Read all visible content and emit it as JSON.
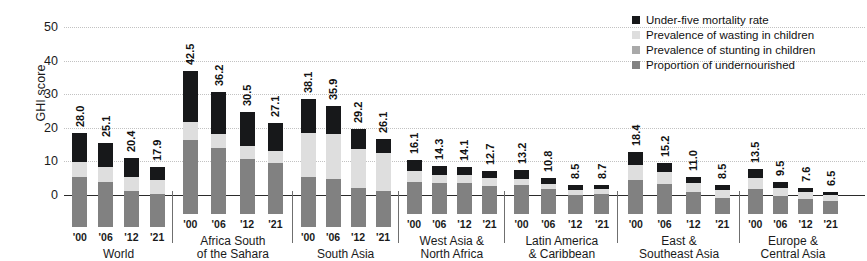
{
  "chart_data": {
    "type": "bar",
    "subtype": "stacked-grouped-bar",
    "title": "",
    "xlabel": "",
    "ylabel": "GHI score",
    "ylim": [
      0,
      50
    ],
    "yticks": [
      0,
      10,
      20,
      30,
      40,
      50
    ],
    "grid": true,
    "legend_position": "top-right",
    "categories": [
      "'00",
      "'06",
      "'12",
      "'21"
    ],
    "groups": [
      {
        "name": "World",
        "name_lines": [
          "World"
        ],
        "bars": [
          {
            "year": "'00",
            "total": "28.0",
            "segments": {
              "undernourished": 14.8,
              "stunting": 0.0,
              "wasting": 4.6,
              "mortality": 8.6
            }
          },
          {
            "year": "'06",
            "total": "25.1",
            "segments": {
              "undernourished": 13.3,
              "stunting": 0.0,
              "wasting": 4.5,
              "mortality": 7.3
            }
          },
          {
            "year": "'12",
            "total": "20.4",
            "segments": {
              "undernourished": 10.6,
              "stunting": 0.0,
              "wasting": 4.4,
              "mortality": 5.4
            }
          },
          {
            "year": "'21",
            "total": "17.9",
            "segments": {
              "undernourished": 9.8,
              "stunting": 0.0,
              "wasting": 4.3,
              "mortality": 3.8
            }
          }
        ]
      },
      {
        "name": "Africa South of the Sahara",
        "name_lines": [
          "Africa South",
          "of the Sahara"
        ],
        "bars": [
          {
            "year": "'00",
            "total": "42.5",
            "segments": {
              "undernourished": 21.9,
              "stunting": 0.0,
              "wasting": 5.4,
              "mortality": 15.2
            }
          },
          {
            "year": "'06",
            "total": "36.2",
            "segments": {
              "undernourished": 19.6,
              "stunting": 0.0,
              "wasting": 4.2,
              "mortality": 12.4
            }
          },
          {
            "year": "'12",
            "total": "30.5",
            "segments": {
              "undernourished": 16.3,
              "stunting": 0.0,
              "wasting": 3.9,
              "mortality": 10.3
            }
          },
          {
            "year": "'21",
            "total": "27.1",
            "segments": {
              "undernourished": 15.1,
              "stunting": 0.0,
              "wasting": 3.6,
              "mortality": 8.4
            }
          }
        ]
      },
      {
        "name": "South Asia",
        "name_lines": [
          "South Asia"
        ],
        "bars": [
          {
            "year": "'00",
            "total": "38.1",
            "segments": {
              "undernourished": 15.0,
              "stunting": 0.0,
              "wasting": 13.0,
              "mortality": 10.1
            }
          },
          {
            "year": "'06",
            "total": "35.9",
            "segments": {
              "undernourished": 14.2,
              "stunting": 0.0,
              "wasting": 13.4,
              "mortality": 8.3
            }
          },
          {
            "year": "'12",
            "total": "29.2",
            "segments": {
              "undernourished": 11.6,
              "stunting": 0.0,
              "wasting": 11.6,
              "mortality": 6.0
            }
          },
          {
            "year": "'21",
            "total": "26.1",
            "segments": {
              "undernourished": 10.8,
              "stunting": 0.0,
              "wasting": 11.3,
              "mortality": 4.0
            }
          }
        ]
      },
      {
        "name": "West Asia & North Africa",
        "name_lines": [
          "West Asia &",
          "North Africa"
        ],
        "bars": [
          {
            "year": "'00",
            "total": "16.1",
            "segments": {
              "undernourished": 9.6,
              "stunting": 0.0,
              "wasting": 3.2,
              "mortality": 3.3
            }
          },
          {
            "year": "'06",
            "total": "14.3",
            "segments": {
              "undernourished": 9.1,
              "stunting": 0.0,
              "wasting": 2.6,
              "mortality": 2.6
            }
          },
          {
            "year": "'12",
            "total": "14.1",
            "segments": {
              "undernourished": 9.2,
              "stunting": 0.0,
              "wasting": 2.5,
              "mortality": 2.4
            }
          },
          {
            "year": "'21",
            "total": "12.7",
            "segments": {
              "undernourished": 8.4,
              "stunting": 0.0,
              "wasting": 2.3,
              "mortality": 2.0
            }
          }
        ]
      },
      {
        "name": "Latin America & Caribbean",
        "name_lines": [
          "Latin America",
          "& Caribbean"
        ],
        "bars": [
          {
            "year": "'00",
            "total": "13.2",
            "segments": {
              "undernourished": 8.6,
              "stunting": 0.0,
              "wasting": 1.8,
              "mortality": 2.8
            }
          },
          {
            "year": "'06",
            "total": "10.8",
            "segments": {
              "undernourished": 7.5,
              "stunting": 0.0,
              "wasting": 1.5,
              "mortality": 1.8
            }
          },
          {
            "year": "'12",
            "total": "8.5",
            "segments": {
              "undernourished": 5.8,
              "stunting": 0.0,
              "wasting": 1.4,
              "mortality": 1.3
            }
          },
          {
            "year": "'21",
            "total": "8.7",
            "segments": {
              "undernourished": 6.0,
              "stunting": 0.0,
              "wasting": 1.5,
              "mortality": 1.2
            }
          }
        ]
      },
      {
        "name": "East & Southeast Asia",
        "name_lines": [
          "East &",
          "Southeast Asia"
        ],
        "bars": [
          {
            "year": "'00",
            "total": "18.4",
            "segments": {
              "undernourished": 10.2,
              "stunting": 0.0,
              "wasting": 4.5,
              "mortality": 3.7
            }
          },
          {
            "year": "'06",
            "total": "15.2",
            "segments": {
              "undernourished": 9.0,
              "stunting": 0.0,
              "wasting": 3.6,
              "mortality": 2.6
            }
          },
          {
            "year": "'12",
            "total": "11.0",
            "segments": {
              "undernourished": 6.6,
              "stunting": 0.0,
              "wasting": 2.7,
              "mortality": 1.7
            }
          },
          {
            "year": "'21",
            "total": "8.5",
            "segments": {
              "undernourished": 4.8,
              "stunting": 0.0,
              "wasting": 2.4,
              "mortality": 1.3
            }
          }
        ]
      },
      {
        "name": "Europe & Central Asia",
        "name_lines": [
          "Europe &",
          "Central Asia"
        ],
        "bars": [
          {
            "year": "'00",
            "total": "13.5",
            "segments": {
              "undernourished": 7.4,
              "stunting": 0.0,
              "wasting": 3.2,
              "mortality": 2.9
            }
          },
          {
            "year": "'06",
            "total": "9.5",
            "segments": {
              "undernourished": 5.4,
              "stunting": 0.0,
              "wasting": 2.3,
              "mortality": 1.8
            }
          },
          {
            "year": "'12",
            "total": "7.6",
            "segments": {
              "undernourished": 4.5,
              "stunting": 0.0,
              "wasting": 2.0,
              "mortality": 1.1
            }
          },
          {
            "year": "'21",
            "total": "6.5",
            "segments": {
              "undernourished": 4.0,
              "stunting": 0.0,
              "wasting": 1.7,
              "mortality": 0.8
            }
          }
        ]
      }
    ],
    "legend": [
      {
        "key": "mortality",
        "label": "Under-five mortality rate",
        "color": "#17181a"
      },
      {
        "key": "wasting",
        "label": "Prevalence of wasting in children",
        "color": "#dedede"
      },
      {
        "key": "stunting",
        "label": "Prevalence of stunting in children",
        "color": "#a9a9a9"
      },
      {
        "key": "undernourished",
        "label": "Proportion of undernourished",
        "color": "#818181"
      }
    ]
  }
}
